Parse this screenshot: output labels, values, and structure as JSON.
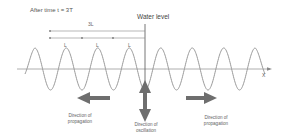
{
  "title": "After time t = 3T",
  "water_level_label": "Water level",
  "bracket": {
    "total_label": "3L",
    "segment_labels": [
      "L",
      "L",
      "L"
    ]
  },
  "axis_label": "X",
  "captions": {
    "left": [
      "Direction of",
      "propagation"
    ],
    "center": [
      "Direction of",
      "oscillation"
    ],
    "right": [
      "Direction of",
      "propagation"
    ]
  },
  "colors": {
    "wave": "#9a9a9a",
    "arrow": "#6e6e6e",
    "lines": "#888888"
  }
}
